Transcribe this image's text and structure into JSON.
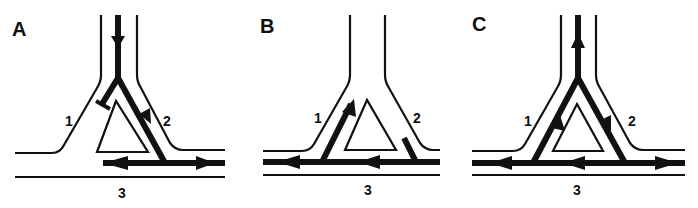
{
  "panels": [
    {
      "id": "A",
      "label": "A",
      "branch_labels": {
        "left": "1",
        "right": "2",
        "bottom": "3"
      }
    },
    {
      "id": "B",
      "label": "B",
      "branch_labels": {
        "left": "1",
        "right": "2",
        "bottom": "3"
      }
    },
    {
      "id": "C",
      "label": "C",
      "branch_labels": {
        "left": "1",
        "right": "2",
        "bottom": "3"
      }
    }
  ],
  "colors": {
    "ink": "#111111",
    "background": "#ffffff"
  }
}
